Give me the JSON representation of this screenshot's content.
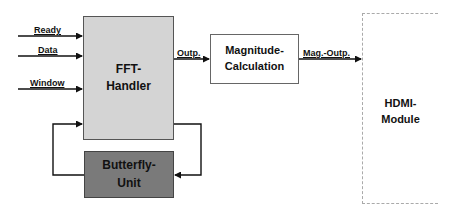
{
  "blocks": {
    "fft_handler": {
      "line1": "FFT-",
      "line2": "Handler",
      "fill": "#d4d4d4"
    },
    "butterfly_unit": {
      "line1": "Butterfly-",
      "line2": "Unit",
      "fill": "#7a7a7a"
    },
    "magnitude_calculation": {
      "line1": "Magnitude-",
      "line2": "Calculation",
      "fill": "#ffffff"
    },
    "hdmi_module": {
      "line1": "HDMI-",
      "line2": "Module",
      "fill": "#ffffff"
    }
  },
  "signals": {
    "ready": "Ready",
    "data": "Data",
    "window": "Window",
    "fft_output": "Outp.",
    "mag_output": "Mag.-Outp."
  }
}
